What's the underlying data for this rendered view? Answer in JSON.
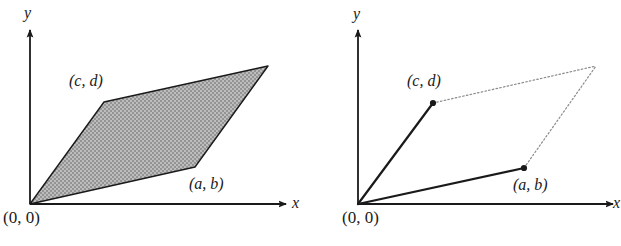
{
  "figure": {
    "background_color": "#ffffff",
    "stroke_color": "#1a1a1a",
    "fill_color": "#a8a8a8",
    "dotted_color": "#8a8a8a"
  },
  "panels": [
    {
      "id": "left",
      "description": "shaded parallelogram spanned by vectors (a, b) and (c, d)",
      "axes": {
        "y_label": "y",
        "x_label": "x"
      },
      "origin_label": "(0, 0)",
      "vertex_labels": {
        "cd": "(c, d)",
        "ab": "(a, b)"
      },
      "shape": {
        "type": "parallelogram",
        "filled": true,
        "vertices": [
          {
            "name": "origin",
            "x": 0,
            "y": 0
          },
          {
            "name": "c,d",
            "x": 74,
            "y": 102
          },
          {
            "name": "a+c,b+d",
            "x": 238,
            "y": 139
          },
          {
            "name": "a,b",
            "x": 165,
            "y": 38
          }
        ]
      }
    },
    {
      "id": "right",
      "description": "two vectors from origin to (a, b) and (c, d) with dotted completion of the parallelogram",
      "axes": {
        "y_label": "y",
        "x_label": "x"
      },
      "origin_label": "(0, 0)",
      "vertex_labels": {
        "cd": "(c, d)",
        "ab": "(a, b)"
      },
      "shape": {
        "type": "vectors-with-dotted-parallelogram",
        "filled": false,
        "points": [
          {
            "name": "origin",
            "x": 0,
            "y": 0,
            "dot": false
          },
          {
            "name": "c,d",
            "x": 75,
            "y": 101,
            "dot": true
          },
          {
            "name": "a,b",
            "x": 166,
            "y": 36,
            "dot": true
          },
          {
            "name": "a+c,b+d",
            "x": 238,
            "y": 139,
            "dot": false
          }
        ],
        "solid_segments": [
          [
            "origin",
            "c,d"
          ],
          [
            "origin",
            "a,b"
          ]
        ],
        "dotted_segments": [
          [
            "c,d",
            "a+c,b+d"
          ],
          [
            "a,b",
            "a+c,b+d"
          ]
        ]
      }
    }
  ]
}
